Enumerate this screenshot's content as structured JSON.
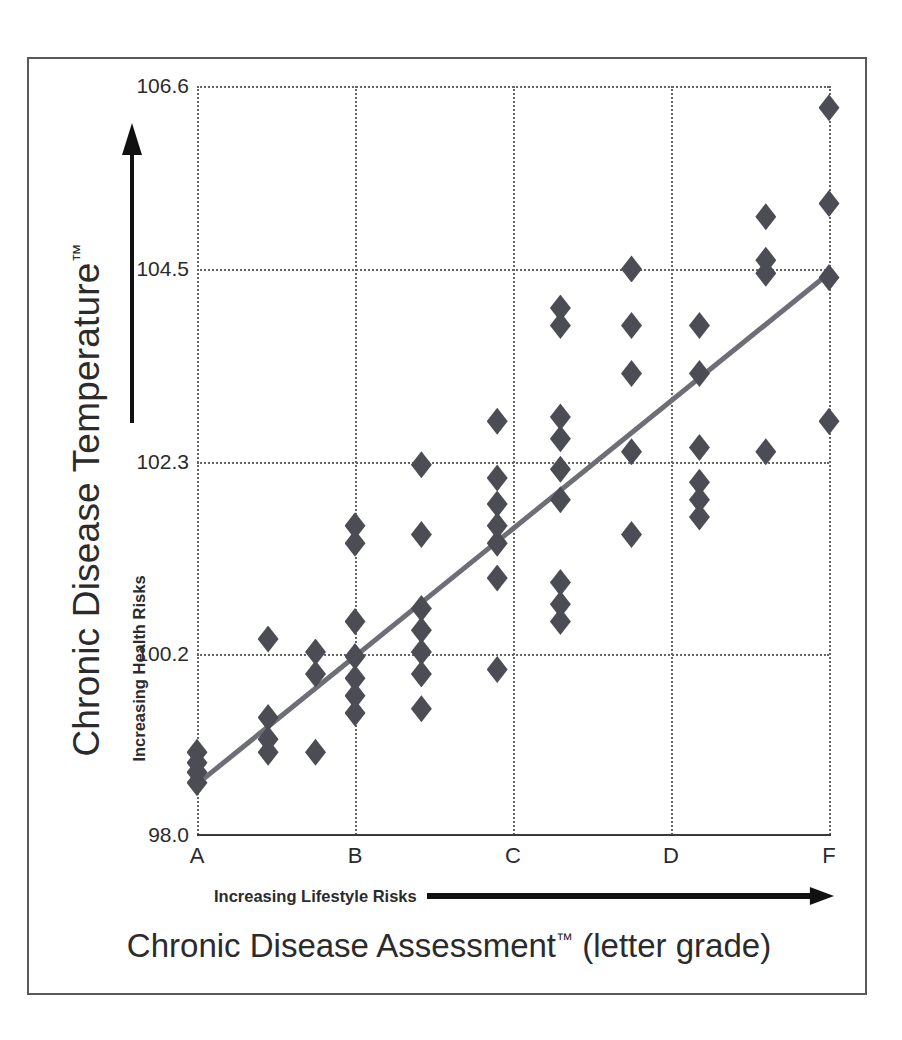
{
  "chart_data": {
    "type": "scatter",
    "title": "",
    "xlabel": "Chronic Disease Assessment™ (letter grade)",
    "ylabel": "Chronic Disease Temperature™",
    "x_sub_label": "Increasing Lifestyle Risks",
    "y_sub_label": "Increasing Health Risks",
    "categories": [
      "A",
      "B",
      "C",
      "D",
      "F"
    ],
    "xtick_labels": [
      "A",
      "B",
      "C",
      "D",
      "F"
    ],
    "ytick_labels": [
      "106.6",
      "104.5",
      "102.3",
      "100.2",
      "98.0"
    ],
    "ylim": [
      98.0,
      106.6
    ],
    "grid": true,
    "legend": "none",
    "marker_shape": "diamond",
    "marker_color": "#4c4c54",
    "trendline_color": "#6e6e76",
    "trendline": {
      "x_start": 0.045,
      "y_start": 98.65,
      "x_end": 4.0,
      "y_end": 104.45
    },
    "points": [
      {
        "grade": "A",
        "gx": 0.0,
        "y": 98.95
      },
      {
        "grade": "A",
        "gx": 0.0,
        "y": 98.83
      },
      {
        "grade": "A",
        "gx": 0.0,
        "y": 98.72
      },
      {
        "grade": "A",
        "gx": 0.0,
        "y": 98.6
      },
      {
        "grade": "A+",
        "gx": 0.45,
        "y": 100.25
      },
      {
        "grade": "A+",
        "gx": 0.45,
        "y": 99.35
      },
      {
        "grade": "A+",
        "gx": 0.45,
        "y": 99.1
      },
      {
        "grade": "A+",
        "gx": 0.45,
        "y": 98.95
      },
      {
        "grade": "A2",
        "gx": 0.75,
        "y": 100.1
      },
      {
        "grade": "A2",
        "gx": 0.75,
        "y": 99.85
      },
      {
        "grade": "A2",
        "gx": 0.75,
        "y": 98.95
      },
      {
        "grade": "B-",
        "gx": 1.0,
        "y": 101.55
      },
      {
        "grade": "B-",
        "gx": 1.0,
        "y": 101.35
      },
      {
        "grade": "B-",
        "gx": 1.0,
        "y": 100.45
      },
      {
        "grade": "B-",
        "gx": 1.0,
        "y": 100.05
      },
      {
        "grade": "B-",
        "gx": 1.0,
        "y": 99.8
      },
      {
        "grade": "B-",
        "gx": 1.0,
        "y": 99.6
      },
      {
        "grade": "B-",
        "gx": 1.0,
        "y": 99.4
      },
      {
        "grade": "B",
        "gx": 1.42,
        "y": 102.25
      },
      {
        "grade": "B",
        "gx": 1.42,
        "y": 101.45
      },
      {
        "grade": "B",
        "gx": 1.42,
        "y": 100.6
      },
      {
        "grade": "B",
        "gx": 1.42,
        "y": 100.35
      },
      {
        "grade": "B",
        "gx": 1.42,
        "y": 100.1
      },
      {
        "grade": "B",
        "gx": 1.42,
        "y": 99.85
      },
      {
        "grade": "B",
        "gx": 1.42,
        "y": 99.45
      },
      {
        "grade": "C-",
        "gx": 1.9,
        "y": 102.75
      },
      {
        "grade": "C-",
        "gx": 1.9,
        "y": 102.1
      },
      {
        "grade": "C-",
        "gx": 1.9,
        "y": 101.8
      },
      {
        "grade": "C-",
        "gx": 1.9,
        "y": 101.55
      },
      {
        "grade": "C-",
        "gx": 1.9,
        "y": 101.35
      },
      {
        "grade": "C-",
        "gx": 1.9,
        "y": 100.95
      },
      {
        "grade": "C-",
        "gx": 1.9,
        "y": 99.9
      },
      {
        "grade": "C",
        "gx": 2.3,
        "y": 104.05
      },
      {
        "grade": "C",
        "gx": 2.3,
        "y": 103.85
      },
      {
        "grade": "C",
        "gx": 2.3,
        "y": 102.8
      },
      {
        "grade": "C",
        "gx": 2.3,
        "y": 102.55
      },
      {
        "grade": "C",
        "gx": 2.3,
        "y": 102.2
      },
      {
        "grade": "C",
        "gx": 2.3,
        "y": 101.85
      },
      {
        "grade": "C",
        "gx": 2.3,
        "y": 100.9
      },
      {
        "grade": "C",
        "gx": 2.3,
        "y": 100.65
      },
      {
        "grade": "C",
        "gx": 2.3,
        "y": 100.45
      },
      {
        "grade": "D-",
        "gx": 2.75,
        "y": 104.5
      },
      {
        "grade": "D-",
        "gx": 2.75,
        "y": 103.85
      },
      {
        "grade": "D-",
        "gx": 2.75,
        "y": 103.3
      },
      {
        "grade": "D-",
        "gx": 2.75,
        "y": 102.4
      },
      {
        "grade": "D-",
        "gx": 2.75,
        "y": 101.45
      },
      {
        "grade": "D",
        "gx": 3.18,
        "y": 103.85
      },
      {
        "grade": "D",
        "gx": 3.18,
        "y": 103.3
      },
      {
        "grade": "D",
        "gx": 3.18,
        "y": 102.45
      },
      {
        "grade": "D",
        "gx": 3.18,
        "y": 102.05
      },
      {
        "grade": "D",
        "gx": 3.18,
        "y": 101.85
      },
      {
        "grade": "D",
        "gx": 3.18,
        "y": 101.65
      },
      {
        "grade": "F-",
        "gx": 3.6,
        "y": 105.1
      },
      {
        "grade": "F-",
        "gx": 3.6,
        "y": 104.6
      },
      {
        "grade": "F-",
        "gx": 3.6,
        "y": 104.45
      },
      {
        "grade": "F-",
        "gx": 3.6,
        "y": 102.4
      },
      {
        "grade": "F",
        "gx": 4.0,
        "y": 106.35
      },
      {
        "grade": "F",
        "gx": 4.0,
        "y": 105.25
      },
      {
        "grade": "F",
        "gx": 4.0,
        "y": 102.75
      },
      {
        "grade": "F",
        "gx": 4.0,
        "y": 104.4
      }
    ]
  }
}
